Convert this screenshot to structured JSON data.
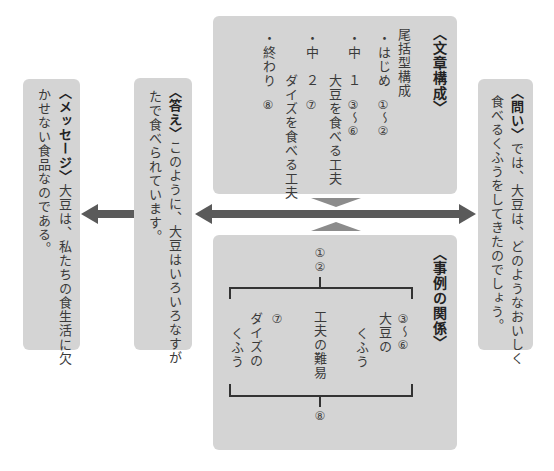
{
  "question": {
    "label": "〈問い〉",
    "text_line1": "では、大豆は、どのようなおいしく",
    "text_line2": "食べるくふうをしてきたのでしょう。"
  },
  "structure": {
    "title": "〈文章構成〉",
    "type": "尾括型構成",
    "items": [
      {
        "bullet": "・",
        "label": "はじめ",
        "range": "①〜②"
      },
      {
        "bullet": "・",
        "label": "中　１",
        "range": "③〜⑥",
        "detail": "大豆を食べる工夫"
      },
      {
        "bullet": "・",
        "label": "中　２",
        "range": "⑦",
        "detail": "ダイズを食べる工夫"
      },
      {
        "bullet": "・",
        "label": "終わり",
        "range": "⑧"
      }
    ]
  },
  "relation": {
    "title": "〈事例の関係〉",
    "top": [
      "①",
      "②"
    ],
    "right_range": "③〜⑥",
    "right_label_1": "大豆の",
    "right_label_2": "くふう",
    "center_label": "工夫の難易",
    "left_range": "⑦",
    "left_label_1": "ダイズの",
    "left_label_2": "くふう",
    "bottom": "⑧"
  },
  "answer": {
    "label": "〈答え〉",
    "text_line1": "このように、大豆はいろいろなすが",
    "text_line2": "たで食べられています。"
  },
  "message": {
    "label": "〈メッセージ〉",
    "text_line1": "大豆は、私たちの食生活に欠",
    "text_line2": "かせない食品なのである。"
  },
  "colors": {
    "box": "#d4d4d4",
    "arrow": "#5a5a5a",
    "triangle": "#8c8c8c"
  }
}
